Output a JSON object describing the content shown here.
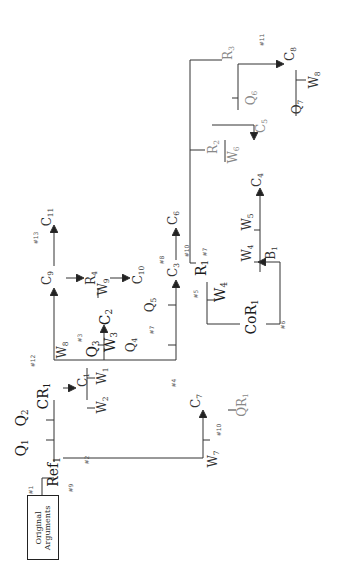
{
  "diagram": {
    "orientation": "rotated-90-ccw",
    "origin_box": {
      "line1": "Original",
      "line2": "Arguments"
    },
    "nodes": [
      {
        "id": "Ref1",
        "base": "Ref",
        "sub": "1",
        "x": 54,
        "y": 472,
        "cls": "big"
      },
      {
        "id": "Q1",
        "base": "Q",
        "sub": "1",
        "x": 22,
        "y": 448,
        "cls": "big"
      },
      {
        "id": "Q2",
        "base": "Q",
        "sub": "2",
        "x": 22,
        "y": 418,
        "cls": "big"
      },
      {
        "id": "CR1",
        "base": "CR",
        "sub": "1",
        "x": 44,
        "y": 396,
        "cls": "big"
      },
      {
        "id": "C1",
        "base": "C",
        "sub": "1",
        "x": 84,
        "y": 380,
        "cls": "med"
      },
      {
        "id": "W1",
        "base": "W",
        "sub": "1",
        "x": 103,
        "y": 376,
        "cls": "med"
      },
      {
        "id": "W2",
        "base": "W",
        "sub": "2",
        "x": 103,
        "y": 405,
        "cls": "med"
      },
      {
        "id": "C7",
        "base": "C",
        "sub": "7",
        "x": 197,
        "y": 401,
        "cls": "med"
      },
      {
        "id": "W7",
        "base": "W",
        "sub": "7",
        "x": 214,
        "y": 459,
        "cls": "med"
      },
      {
        "id": "QR1",
        "base": "QR",
        "sub": "1",
        "x": 243,
        "y": 405,
        "cls": "grey"
      },
      {
        "id": "W8",
        "base": "W",
        "sub": "8",
        "x": 63,
        "y": 350,
        "cls": "med"
      },
      {
        "id": "Q3",
        "base": "Q",
        "sub": "3",
        "x": 93,
        "y": 349,
        "cls": "big"
      },
      {
        "id": "W3",
        "base": "W",
        "sub": "3",
        "x": 111,
        "y": 342,
        "cls": "big"
      },
      {
        "id": "C2",
        "base": "C",
        "sub": "2",
        "x": 106,
        "y": 317,
        "cls": "big"
      },
      {
        "id": "Q4",
        "base": "Q",
        "sub": "4",
        "x": 132,
        "y": 345,
        "cls": "med"
      },
      {
        "id": "Q5",
        "base": "Q",
        "sub": "5",
        "x": 151,
        "y": 305,
        "cls": "med"
      },
      {
        "id": "C10",
        "base": "C",
        "sub": "10",
        "x": 139,
        "y": 275,
        "cls": "med"
      },
      {
        "id": "C9",
        "base": "C",
        "sub": "9",
        "x": 48,
        "y": 278,
        "cls": "med"
      },
      {
        "id": "C11",
        "base": "C",
        "sub": "11",
        "x": 48,
        "y": 217,
        "cls": "med"
      },
      {
        "id": "R4",
        "base": "R",
        "sub": "4",
        "x": 92,
        "y": 278,
        "cls": "med"
      },
      {
        "id": "W9",
        "base": "W",
        "sub": "9",
        "x": 104,
        "y": 287,
        "cls": "med"
      },
      {
        "id": "C3",
        "base": "C",
        "sub": "3",
        "x": 174,
        "y": 270,
        "cls": "med"
      },
      {
        "id": "C6",
        "base": "C",
        "sub": "6",
        "x": 174,
        "y": 218,
        "cls": "med"
      },
      {
        "id": "R1",
        "base": "R",
        "sub": "1",
        "x": 202,
        "y": 268,
        "cls": "big"
      },
      {
        "id": "W4a",
        "base": "W",
        "sub": "4",
        "x": 221,
        "y": 292,
        "cls": "big"
      },
      {
        "id": "CoR1",
        "base": "CoR",
        "sub": "1",
        "x": 252,
        "y": 317,
        "cls": "big"
      },
      {
        "id": "W4b",
        "base": "W",
        "sub": "4",
        "x": 248,
        "y": 253,
        "cls": "med"
      },
      {
        "id": "W5",
        "base": "W",
        "sub": "5",
        "x": 248,
        "y": 222,
        "cls": "med"
      },
      {
        "id": "C4",
        "base": "C",
        "sub": "4",
        "x": 258,
        "y": 180,
        "cls": "med"
      },
      {
        "id": "B1",
        "base": "B",
        "sub": "1",
        "x": 272,
        "y": 253,
        "cls": "med"
      },
      {
        "id": "R2",
        "base": "R",
        "sub": "2",
        "x": 214,
        "y": 147,
        "cls": "grey"
      },
      {
        "id": "W6",
        "base": "W",
        "sub": "6",
        "x": 234,
        "y": 155,
        "cls": "grey"
      },
      {
        "id": "C5",
        "base": "C",
        "sub": "5",
        "x": 262,
        "y": 126,
        "cls": "grey"
      },
      {
        "id": "Q6",
        "base": "Q",
        "sub": "6",
        "x": 252,
        "y": 98,
        "cls": "grey"
      },
      {
        "id": "R3",
        "base": "R",
        "sub": "3",
        "x": 229,
        "y": 53,
        "cls": "grey"
      },
      {
        "id": "C8",
        "base": "C",
        "sub": "8",
        "x": 291,
        "y": 54,
        "cls": "med"
      },
      {
        "id": "Q7",
        "base": "Q",
        "sub": "7",
        "x": 298,
        "y": 107,
        "cls": "med"
      },
      {
        "id": "W8b",
        "base": "W",
        "sub": "8",
        "x": 315,
        "y": 80,
        "cls": "med"
      }
    ],
    "tags": [
      {
        "text": "#1",
        "x": 31,
        "y": 490
      },
      {
        "text": "#2",
        "x": 87,
        "y": 460
      },
      {
        "text": "#9",
        "x": 71,
        "y": 488
      },
      {
        "text": "#4",
        "x": 174,
        "y": 383
      },
      {
        "text": "#10",
        "x": 219,
        "y": 430
      },
      {
        "text": "#12",
        "x": 33,
        "y": 361
      },
      {
        "text": "#3",
        "x": 80,
        "y": 338
      },
      {
        "text": "#7",
        "x": 152,
        "y": 330
      },
      {
        "text": "#5",
        "x": 196,
        "y": 294
      },
      {
        "text": "#8",
        "x": 162,
        "y": 260
      },
      {
        "text": "#10",
        "x": 187,
        "y": 251
      },
      {
        "text": "#7",
        "x": 205,
        "y": 252
      },
      {
        "text": "#6",
        "x": 283,
        "y": 325
      },
      {
        "text": "#13",
        "x": 36,
        "y": 238
      },
      {
        "text": "#11",
        "x": 262,
        "y": 40
      }
    ]
  }
}
